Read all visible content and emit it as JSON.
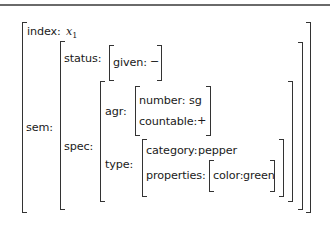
{
  "avm": {
    "index": {
      "label": "index:",
      "value_var": "x",
      "value_sub": "1"
    },
    "sem": {
      "label": "sem:",
      "status": {
        "label": "status:",
        "given": {
          "label": "given:",
          "value": "−"
        }
      },
      "spec": {
        "label": "spec:",
        "agr": {
          "label": "agr:",
          "number": {
            "label": "number:",
            "value": "sg"
          },
          "countable": {
            "label": "countable:",
            "value": "+"
          }
        },
        "type": {
          "label": "type:",
          "category": {
            "label": "category:",
            "value": "pepper"
          },
          "properties": {
            "label": "properties:",
            "color": {
              "label": "color:",
              "value": "green"
            }
          }
        }
      }
    }
  },
  "colors": {
    "rule": "#6a6a6a",
    "bracket": "#333333",
    "text": "#1a1a1a"
  }
}
